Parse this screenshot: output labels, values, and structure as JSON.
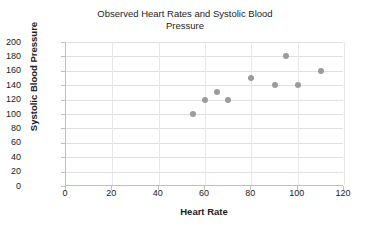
{
  "chart_data": {
    "type": "scatter",
    "title": "Observed Heart Rates and Systolic Blood\nPressure",
    "title_line1": "Observed Heart Rates and Systolic Blood",
    "title_line2": "Pressure",
    "xlabel": "Heart Rate",
    "ylabel": "Systolic Blood Pressure",
    "xlim": [
      0,
      120
    ],
    "ylim": [
      0,
      200
    ],
    "xticks": [
      0,
      20,
      40,
      60,
      80,
      100,
      120
    ],
    "yticks": [
      0,
      20,
      40,
      60,
      80,
      100,
      120,
      140,
      160,
      180,
      200
    ],
    "grid": true,
    "legend": false,
    "marker_color": "#9b9b9b",
    "gridline_color": "#e0e0e0",
    "axis_color": "#bfbfbf",
    "series": [
      {
        "name": "Observations",
        "points": [
          {
            "x": 55,
            "y": 100
          },
          {
            "x": 60,
            "y": 120
          },
          {
            "x": 65,
            "y": 130
          },
          {
            "x": 70,
            "y": 120
          },
          {
            "x": 80,
            "y": 150
          },
          {
            "x": 90,
            "y": 140
          },
          {
            "x": 95,
            "y": 180
          },
          {
            "x": 100,
            "y": 140
          },
          {
            "x": 110,
            "y": 160
          }
        ]
      }
    ]
  }
}
